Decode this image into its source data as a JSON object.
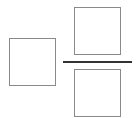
{
  "diagram": {
    "left_box": {
      "label": ""
    },
    "numerator_box": {
      "label": ""
    },
    "denominator_box": {
      "label": ""
    },
    "fraction_bar": {
      "label": ""
    },
    "colors": {
      "box_border": "#8a8a8a",
      "bar": "#333333",
      "background": "#ffffff"
    }
  }
}
